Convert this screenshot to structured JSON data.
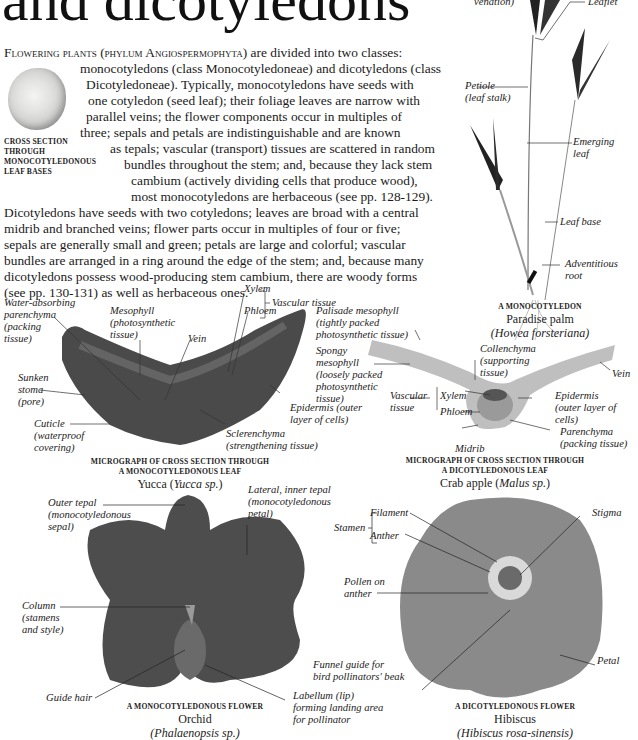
{
  "page": {
    "title": "and dicotyledons",
    "intro_lead": "Flowering plants (phylum Angiospermophyta)",
    "intro_lines": [
      " are divided into two classes:",
      "monocotyledons (class Monocotyledoneae) and dicotyledons (class",
      "Dicotyledoneae). Typically, monocotyledons have seeds with",
      "one cotyledon (seed leaf); their foliage leaves are narrow with",
      "parallel veins; the flower components occur in multiples of",
      "three; sepals and petals are indistinguishable and are known",
      "as tepals; vascular (transport) tissues are scattered in random",
      "bundles throughout the stem; and, because they lack stem",
      "cambium (actively dividing cells that produce wood),",
      "most monocotyledons are herbaceous (see pp. 128-129).",
      "Dicotyledons have seeds with two cotyledons; leaves are broad with a central",
      "midrib and branched veins; flower parts occur in multiples of four or five;",
      "sepals are generally small and green; petals are large and colorful; vascular",
      "bundles are arranged in a ring around the edge of the stem; and, because many",
      "dicotyledons possess wood-producing stem cambium, there are woody forms",
      "(see pp. 130-131) as well as herbaceous ones."
    ]
  },
  "figures": {
    "leaf_bases": {
      "caption_lines": [
        "CROSS SECTION",
        "THROUGH",
        "MONOCOTYLEDONOUS",
        "LEAF BASES"
      ]
    },
    "palm": {
      "labels": {
        "venation": "venation)",
        "leaflet": "Leaflet",
        "petiole": [
          "Petiole",
          "(leaf stalk)"
        ],
        "emerging_leaf": [
          "Emerging",
          "leaf"
        ],
        "leaf_base": "Leaf base",
        "adventitious_root": [
          "Adventitious",
          "root"
        ]
      },
      "caption": "A MONOCOTYLEDON",
      "common_name": "Paradise palm",
      "latin_name": "(Howea forsteriana)"
    },
    "yucca_leaf": {
      "labels": {
        "water_absorbing": [
          "Water-absorbing",
          "parenchyma",
          "(packing",
          "tissue)"
        ],
        "mesophyll": [
          "Mesophyll",
          "(photosynthetic",
          "tissue)"
        ],
        "vein": "Vein",
        "xylem": "Xylem",
        "phloem": "Phloem",
        "vascular_tissue": "Vascular tissue",
        "sunken_stoma": [
          "Sunken",
          "stoma",
          "(pore)"
        ],
        "cuticle": [
          "Cuticle",
          "(waterproof",
          "covering)"
        ],
        "epidermis": [
          "Epidermis (outer",
          "layer of cells)"
        ],
        "sclerenchyma": [
          "Sclerenchyma",
          "(strengthening tissue)"
        ]
      },
      "caption_lines": [
        "MICROGRAPH OF CROSS SECTION THROUGH",
        "A MONOCOTYLEDONOUS LEAF"
      ],
      "common_name": "Yucca (",
      "latin_name": "Yucca sp.",
      "close": ")"
    },
    "crab_apple_leaf": {
      "labels": {
        "palisade": [
          "Palisade mesophyll",
          "(tightly packed",
          "photosynthetic tissue)"
        ],
        "spongy": [
          "Spongy",
          "mesophyll",
          "(loosely packed",
          "photosynthetic",
          "tissue)"
        ],
        "collenchyma": [
          "Collenchyma",
          "(supporting",
          "tissue)"
        ],
        "vein": "Vein",
        "vascular_tissue": [
          "Vascular",
          "tissue"
        ],
        "xylem": "Xylem",
        "phloem": "Phloem",
        "epidermis": [
          "Epidermis",
          "(outer layer of",
          "cells)"
        ],
        "parenchyma": [
          "Parenchyma",
          "(packing tissue)"
        ],
        "midrib": "Midrib"
      },
      "caption_lines": [
        "MICROGRAPH OF CROSS SECTION THROUGH",
        "A DICOTYLEDONOUS LEAF"
      ],
      "common_name": "Crab apple (",
      "latin_name": "Malus sp.",
      "close": ")"
    },
    "orchid": {
      "labels": {
        "outer_tepal": [
          "Outer tepal",
          "(monocotyledonous",
          "sepal)"
        ],
        "lateral_tepal": [
          "Lateral, inner tepal",
          "(monocotyledonous",
          "petal)"
        ],
        "column": [
          "Column",
          "(stamens",
          "and style)"
        ],
        "guide_hair": "Guide hair",
        "labellum": [
          "Labellum (lip)",
          "forming landing area",
          "for pollinator"
        ]
      },
      "caption": "A MONOCOTYLEDONOUS FLOWER",
      "common_name": "Orchid",
      "latin_name": "(Phalaenopsis sp.)"
    },
    "hibiscus": {
      "labels": {
        "stamen": "Stamen",
        "filament": "Filament",
        "anther": "Anther",
        "stigma": "Stigma",
        "pollen": [
          "Pollen on",
          "anther"
        ],
        "funnel_guide": [
          "Funnel guide for",
          "bird pollinators' beak"
        ],
        "petal": "Petal"
      },
      "caption": "A DICOTYLEDONOUS FLOWER",
      "common_name": "Hibiscus",
      "latin_name": "(Hibiscus rosa-sinensis)"
    }
  }
}
